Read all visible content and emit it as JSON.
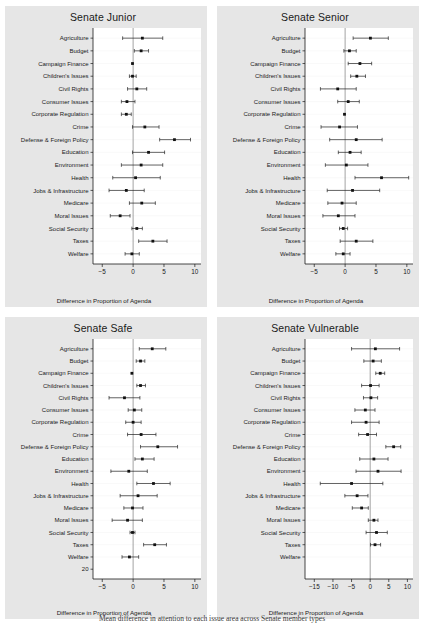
{
  "figure": {
    "caption": "Mean difference in attention to each issue area across Senate member types"
  },
  "categories": [
    "Agriculture",
    "Budget",
    "Campaign Finance",
    "Children's Issues",
    "Civil Rights",
    "Consumer Issues",
    "Corporate Regulation",
    "Crime",
    "Defense & Foreign Policy",
    "Education",
    "Environment",
    "Health",
    "Jobs & Infrastructure",
    "Medicare",
    "Moral Issues",
    "Social Security",
    "Taxes",
    "Welfare"
  ],
  "chart_data": [
    {
      "type": "scatter",
      "title": "Senate Junior",
      "xlabel": "Difference in Proportion of Agenda",
      "ylabel": "",
      "xlim": [
        -6.5,
        11.0
      ],
      "xticks": [
        -5,
        0,
        5,
        10
      ],
      "xticklabels": [
        "−5",
        "0",
        "5",
        "10"
      ],
      "extra_yticklabels": [],
      "grid": true,
      "legend": "none",
      "categories": [
        "Agriculture",
        "Budget",
        "Campaign Finance",
        "Children's Issues",
        "Civil Rights",
        "Consumer Issues",
        "Corporate Regulation",
        "Crime",
        "Defense & Foreign Policy",
        "Education",
        "Environment",
        "Health",
        "Jobs & Infrastructure",
        "Medicare",
        "Moral Issues",
        "Social Security",
        "Taxes",
        "Welfare"
      ],
      "estimates": [
        1.5,
        1.3,
        -0.1,
        -0.1,
        0.6,
        -1.0,
        -1.1,
        1.9,
        6.7,
        2.5,
        1.3,
        0.4,
        -1.1,
        1.4,
        -2.1,
        0.6,
        3.2,
        -0.2
      ],
      "ci_low": [
        -1.7,
        0.2,
        -0.1,
        -0.6,
        -0.9,
        -1.9,
        -1.9,
        -0.1,
        4.3,
        -0.1,
        -1.9,
        -3.3,
        -3.9,
        -0.6,
        -3.7,
        -0.2,
        0.9,
        -1.3
      ],
      "ci_high": [
        4.8,
        2.5,
        -0.1,
        0.5,
        2.2,
        0.3,
        -0.3,
        4.2,
        9.3,
        5.1,
        4.8,
        4.4,
        1.8,
        3.6,
        -0.5,
        1.5,
        5.5,
        1.0
      ]
    },
    {
      "type": "scatter",
      "title": "Senate Senior",
      "xlabel": "Difference in Proportion of Agenda",
      "ylabel": "",
      "xlim": [
        -6.5,
        11.0
      ],
      "xticks": [
        -5,
        0,
        5,
        10
      ],
      "xticklabels": [
        "−5",
        "0",
        "5",
        "10"
      ],
      "extra_yticklabels": [],
      "grid": true,
      "legend": "none",
      "categories": [
        "Agriculture",
        "Budget",
        "Campaign Finance",
        "Children's Issues",
        "Civil Rights",
        "Consumer Issues",
        "Corporate Regulation",
        "Crime",
        "Defense & Foreign Policy",
        "Education",
        "Environment",
        "Health",
        "Jobs & Infrastructure",
        "Medicare",
        "Moral Issues",
        "Social Security",
        "Taxes",
        "Welfare"
      ],
      "estimates": [
        4.1,
        0.7,
        2.4,
        1.9,
        -1.2,
        0.5,
        -0.1,
        -0.9,
        1.8,
        0.8,
        0.2,
        5.9,
        1.2,
        -0.5,
        -1.1,
        -0.3,
        1.8,
        -0.3
      ],
      "ci_low": [
        1.3,
        -0.2,
        0.5,
        0.9,
        -4.0,
        -1.2,
        -0.1,
        -3.9,
        -2.5,
        -1.1,
        -3.2,
        1.6,
        -2.9,
        -2.8,
        -3.6,
        -0.9,
        -0.8,
        -1.5
      ],
      "ci_high": [
        7.0,
        1.8,
        4.3,
        3.3,
        1.8,
        2.3,
        -0.1,
        2.0,
        6.0,
        2.6,
        3.7,
        10.3,
        5.6,
        1.8,
        1.6,
        0.4,
        4.5,
        0.8
      ]
    },
    {
      "type": "scatter",
      "title": "Senate Safe",
      "xlabel": "Difference in Proportion of Agenda",
      "ylabel": "",
      "xlim": [
        -6.5,
        11.0
      ],
      "xticks": [
        -5,
        0,
        5,
        10
      ],
      "xticklabels": [
        "−5",
        "0",
        "5",
        "10"
      ],
      "extra_yticklabels": [
        "20"
      ],
      "grid": true,
      "legend": "none",
      "categories": [
        "Agriculture",
        "Budget",
        "Campaign Finance",
        "Children's Issues",
        "Civil Rights",
        "Consumer Issues",
        "Corporate Regulation",
        "Crime",
        "Defense & Foreign Policy",
        "Education",
        "Environment",
        "Health",
        "Jobs & Infrastructure",
        "Medicare",
        "Moral Issues",
        "Social Security",
        "Taxes",
        "Welfare"
      ],
      "estimates": [
        3.1,
        1.2,
        -0.2,
        1.2,
        -1.4,
        0.2,
        0.0,
        1.3,
        4.0,
        1.5,
        -0.7,
        3.3,
        0.8,
        -0.1,
        -0.9,
        -0.1,
        3.5,
        -0.6
      ],
      "ci_low": [
        1.0,
        0.5,
        -0.2,
        0.6,
        -3.9,
        -0.8,
        -1.2,
        -0.9,
        1.2,
        0.3,
        -3.6,
        0.6,
        -2.1,
        -1.5,
        -3.4,
        -0.5,
        1.7,
        -1.8
      ],
      "ci_high": [
        5.3,
        1.9,
        -0.2,
        2.0,
        1.1,
        1.4,
        1.3,
        3.7,
        7.2,
        3.4,
        2.3,
        6.0,
        3.9,
        1.6,
        1.5,
        0.3,
        5.4,
        0.9
      ]
    },
    {
      "type": "scatter",
      "title": "Senate Vulnerable",
      "xlabel": "Difference in Proportion of Agenda",
      "ylabel": "",
      "xlim": [
        -17.5,
        11.5
      ],
      "xticks": [
        -15,
        -10,
        -5,
        0,
        5,
        10
      ],
      "xticklabels": [
        "−15",
        "−10",
        "−5",
        "0",
        "5",
        "10"
      ],
      "extra_yticklabels": [],
      "grid": true,
      "legend": "none",
      "categories": [
        "Agriculture",
        "Budget",
        "Campaign Finance",
        "Children's Issues",
        "Civil Rights",
        "Consumer Issues",
        "Corporate Regulation",
        "Crime",
        "Defense & Foreign Policy",
        "Education",
        "Environment",
        "Health",
        "Jobs & Infrastructure",
        "Medicare",
        "Moral Issues",
        "Social Security",
        "Taxes",
        "Welfare"
      ],
      "estimates": [
        1.4,
        0.8,
        2.7,
        0.1,
        0.2,
        -1.3,
        -1.1,
        -0.7,
        6.3,
        1.0,
        2.1,
        -5.0,
        -3.5,
        -2.3,
        1.0,
        1.7,
        1.3,
        null
      ],
      "ci_low": [
        -5.0,
        -1.7,
        1.5,
        -2.3,
        -1.8,
        -4.1,
        -5.0,
        -3.1,
        4.2,
        -2.8,
        -3.8,
        -13.4,
        -6.8,
        -4.8,
        -0.5,
        -1.1,
        0.1,
        null
      ],
      "ci_high": [
        7.9,
        3.0,
        3.9,
        2.4,
        2.0,
        1.3,
        2.4,
        1.7,
        8.2,
        4.8,
        8.3,
        3.4,
        -0.6,
        -0.5,
        2.1,
        4.6,
        2.8,
        null
      ]
    }
  ]
}
